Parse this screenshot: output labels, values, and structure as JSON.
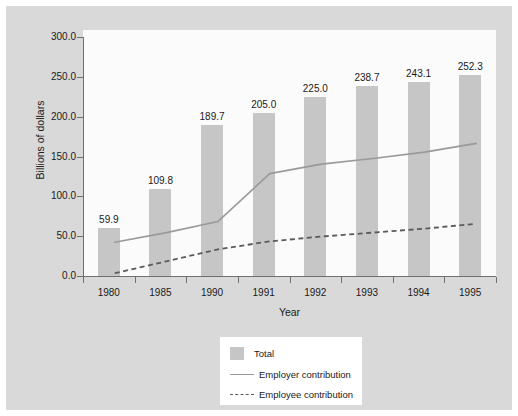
{
  "chart_data": {
    "type": "bar",
    "title": "",
    "xlabel": "Year",
    "ylabel": "Billions of dollars",
    "categories": [
      "1980",
      "1985",
      "1990",
      "1991",
      "1992",
      "1993",
      "1994",
      "1995"
    ],
    "ylim": [
      0,
      300
    ],
    "yticks": [
      "0.0",
      "50.0",
      "100.0",
      "150.0",
      "200.0",
      "250.0",
      "300.0"
    ],
    "ytick_values": [
      0,
      50,
      100,
      150,
      200,
      250,
      300
    ],
    "grid": false,
    "legend_position": "below-center",
    "series": [
      {
        "name": "Total",
        "type": "bar",
        "values": [
          59.9,
          109.8,
          189.7,
          205.0,
          225.0,
          238.7,
          243.1,
          252.3
        ],
        "labels": [
          "59.9",
          "109.8",
          "189.7",
          "205.0",
          "225.0",
          "238.7",
          "243.1",
          "252.3"
        ],
        "color": "#c6c6c6"
      },
      {
        "name": "Employer contribution",
        "type": "line",
        "values": [
          50.0,
          62.0,
          76.0,
          136.0,
          148.0,
          155.0,
          163.0,
          174.0
        ],
        "color": "#9a9a9a",
        "style": "solid"
      },
      {
        "name": "Employee contribution",
        "type": "line",
        "values": [
          11.0,
          26.0,
          41.0,
          51.0,
          57.0,
          62.0,
          67.0,
          73.0
        ],
        "color": "#5a5a5a",
        "style": "dashed"
      }
    ]
  },
  "legend": {
    "items": [
      {
        "label": "Total"
      },
      {
        "label": "Employer contribution"
      },
      {
        "label": "Employee contribution"
      }
    ]
  }
}
